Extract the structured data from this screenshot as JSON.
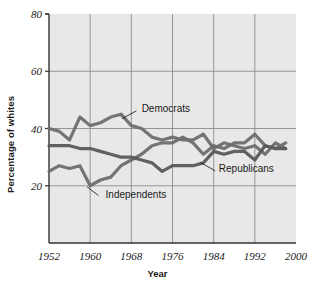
{
  "chart_data": {
    "type": "line",
    "title": "",
    "xlabel": "Year",
    "ylabel": "Percentage of whites",
    "xlim": [
      1952,
      2000
    ],
    "ylim": [
      0,
      80
    ],
    "xticks": [
      1952,
      1960,
      1968,
      1976,
      1984,
      1992,
      2000
    ],
    "yticks": [
      20,
      40,
      60,
      80
    ],
    "grid": true,
    "legend_position": "inline-annotations",
    "annotations": [
      {
        "label": "Democrats",
        "x": 1970,
        "y": 47
      },
      {
        "label": "Independents",
        "x": 1963,
        "y": 17
      },
      {
        "label": "Republicans",
        "x": 1985,
        "y": 26
      }
    ],
    "series": [
      {
        "name": "Democrats",
        "color": "#6e6e6e",
        "x": [
          1952,
          1954,
          1956,
          1958,
          1960,
          1962,
          1964,
          1966,
          1968,
          1970,
          1972,
          1974,
          1976,
          1978,
          1980,
          1982,
          1984,
          1986,
          1988,
          1990,
          1992,
          1994,
          1996,
          1998
        ],
        "values": [
          40,
          39,
          36,
          44,
          41,
          42,
          44,
          45,
          41,
          40,
          37,
          36,
          37,
          36,
          36,
          38,
          33,
          35,
          34,
          33,
          34,
          31,
          35,
          33
        ]
      },
      {
        "name": "Independents",
        "color": "#6e6e6e",
        "x": [
          1952,
          1954,
          1956,
          1958,
          1960,
          1962,
          1964,
          1966,
          1968,
          1970,
          1972,
          1974,
          1976,
          1978,
          1980,
          1982,
          1984,
          1986,
          1988,
          1990,
          1992,
          1994,
          1996,
          1998
        ],
        "values": [
          25,
          27,
          26,
          27,
          20,
          22,
          23,
          27,
          29,
          31,
          34,
          35,
          35,
          37,
          35,
          31,
          34,
          33,
          35,
          35,
          38,
          34,
          33,
          35
        ]
      },
      {
        "name": "Republicans",
        "color": "#5a5a5a",
        "x": [
          1952,
          1954,
          1956,
          1958,
          1960,
          1962,
          1964,
          1966,
          1968,
          1970,
          1972,
          1974,
          1976,
          1978,
          1980,
          1982,
          1984,
          1986,
          1988,
          1990,
          1992,
          1994,
          1996,
          1998
        ],
        "values": [
          34,
          34,
          34,
          33,
          33,
          32,
          31,
          30,
          30,
          29,
          28,
          25,
          27,
          27,
          27,
          28,
          32,
          31,
          32,
          32,
          29,
          34,
          33,
          33
        ]
      }
    ],
    "colors": {
      "plot_background": "#e8e8e8",
      "grid": "#8c8c8c",
      "axis": "#333333",
      "text": "#1a1a1a"
    }
  }
}
